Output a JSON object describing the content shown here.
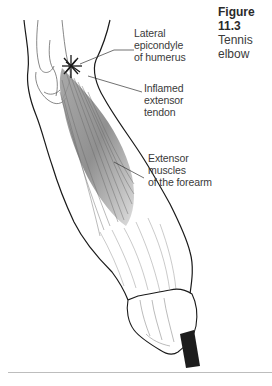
{
  "caption": {
    "figure_number": "Figure 11.3",
    "title": "Tennis elbow"
  },
  "labels": {
    "lateral_epicondyle": [
      "Lateral",
      "epicondyle",
      "of humerus"
    ],
    "inflamed_tendon": [
      "Inflamed",
      "extensor",
      "tendon"
    ],
    "extensor_muscles": [
      "Extensor",
      "muscles",
      "of the forearm"
    ]
  },
  "colors": {
    "outline": "#1a1a1a",
    "muscle_shade": "#8a8a8a",
    "label_text": "#3a3a3a",
    "racket_handle": "#1c1c1c",
    "rule": "#bdbdbd"
  }
}
